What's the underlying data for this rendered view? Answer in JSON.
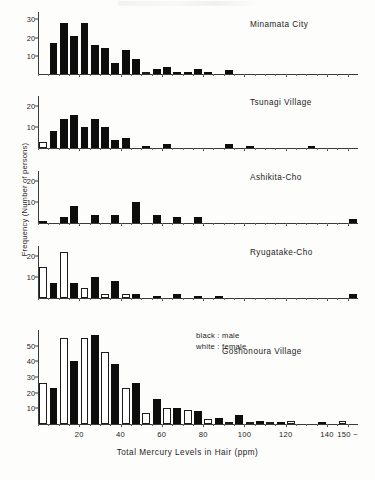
{
  "figure": {
    "xlabel": "Total Mercury Levels in Hair  (ppm)",
    "ylabel": "Frequency (Number of persons)",
    "legend": {
      "male": "black : male",
      "female": "white : female"
    },
    "x_ticks": [
      {
        "value": 20,
        "label": "20"
      },
      {
        "value": 40,
        "label": "40"
      },
      {
        "value": 60,
        "label": "60"
      },
      {
        "value": 80,
        "label": "80"
      },
      {
        "value": 100,
        "label": "100"
      },
      {
        "value": 120,
        "label": "120"
      },
      {
        "value": 140,
        "label": "140"
      },
      {
        "value": 150,
        "label": "150 ~"
      }
    ]
  },
  "chart_data": {
    "type": "bar",
    "title": "",
    "xlabel": "Total Mercury Levels in Hair  (ppm)",
    "ylabel": "Frequency (Number of persons)",
    "xlim": [
      0,
      155
    ],
    "bin_width": 5,
    "grid": false,
    "legend_position": "inside-top-right",
    "series_colors": {
      "male": "#0d0d0d",
      "female": "#ffffff"
    },
    "bin_starts": [
      0,
      5,
      10,
      15,
      20,
      25,
      30,
      35,
      40,
      45,
      50,
      55,
      60,
      65,
      70,
      75,
      80,
      85,
      90,
      95,
      100,
      105,
      110,
      115,
      120,
      125,
      130,
      135,
      140,
      145,
      150
    ],
    "panels": [
      {
        "name": "Minamata City",
        "ylim": [
          0,
          34
        ],
        "y_ticks": [
          10,
          20,
          30
        ],
        "series": [
          {
            "name": "female",
            "values": [
              0,
              0,
              8,
              0,
              2,
              1,
              2,
              1,
              1,
              1,
              1,
              0,
              0,
              0,
              0,
              0,
              0,
              0,
              0,
              0,
              0,
              0,
              0,
              0,
              0,
              0,
              0,
              0,
              0,
              0,
              0
            ]
          },
          {
            "name": "male",
            "values": [
              0,
              17,
              28,
              21,
              28,
              16,
              14,
              6,
              13,
              8,
              0,
              3,
              4,
              1,
              1,
              3,
              1,
              0,
              2,
              0,
              0,
              0,
              0,
              0,
              0,
              0,
              0,
              0,
              0,
              0,
              0
            ]
          }
        ]
      },
      {
        "name": "Tsunagi Village",
        "ylim": [
          0,
          25
        ],
        "y_ticks": [
          10,
          20
        ],
        "series": [
          {
            "name": "female",
            "values": [
              3,
              0,
              2,
              0,
              3,
              0,
              3,
              0,
              0,
              0,
              0,
              0,
              1,
              0,
              0,
              0,
              0,
              0,
              0,
              0,
              0,
              0,
              0,
              0,
              0,
              0,
              0,
              0,
              0,
              0,
              0
            ]
          },
          {
            "name": "male",
            "values": [
              0,
              8,
              14,
              16,
              10,
              14,
              10,
              4,
              5,
              0,
              1,
              0,
              2,
              0,
              0,
              0,
              0,
              0,
              2,
              0,
              1,
              0,
              0,
              0,
              0,
              0,
              1,
              0,
              0,
              0,
              0
            ]
          }
        ]
      },
      {
        "name": "Ashikita-Cho",
        "ylim": [
          0,
          25
        ],
        "y_ticks": [
          10,
          20
        ],
        "series": [
          {
            "name": "female",
            "values": [
              0,
              0,
              0,
              0,
              0,
              0,
              0,
              0,
              0,
              0,
              0,
              0,
              0,
              0,
              0,
              0,
              0,
              0,
              0,
              0,
              0,
              0,
              0,
              0,
              0,
              0,
              0,
              0,
              0,
              0,
              0
            ]
          },
          {
            "name": "male",
            "values": [
              1,
              0,
              3,
              8,
              0,
              4,
              0,
              4,
              0,
              10,
              0,
              4,
              0,
              3,
              0,
              3,
              0,
              0,
              0,
              0,
              0,
              0,
              0,
              0,
              0,
              0,
              0,
              0,
              0,
              0,
              2
            ]
          }
        ]
      },
      {
        "name": "Ryugatake-Cho",
        "ylim": [
          0,
          25
        ],
        "y_ticks": [
          10,
          20
        ],
        "series": [
          {
            "name": "female",
            "values": [
              15,
              0,
              22,
              0,
              5,
              0,
              2,
              0,
              2,
              0,
              0,
              0,
              0,
              0,
              0,
              0,
              0,
              0,
              0,
              0,
              0,
              0,
              0,
              0,
              0,
              0,
              0,
              0,
              0,
              0,
              0
            ]
          },
          {
            "name": "male",
            "values": [
              0,
              7,
              0,
              7,
              0,
              10,
              0,
              8,
              0,
              2,
              0,
              1,
              0,
              2,
              0,
              1,
              0,
              1,
              0,
              0,
              0,
              0,
              0,
              0,
              0,
              0,
              0,
              0,
              0,
              0,
              2
            ]
          }
        ]
      },
      {
        "name": "Goshonoura Village",
        "ylim": [
          0,
          60
        ],
        "y_ticks": [
          10,
          20,
          30,
          40,
          50
        ],
        "series": [
          {
            "name": "female",
            "values": [
              26,
              0,
              55,
              0,
              55,
              0,
              46,
              0,
              23,
              0,
              7,
              0,
              10,
              0,
              9,
              0,
              3,
              0,
              1,
              0,
              1,
              0,
              1,
              0,
              2,
              0,
              0,
              0,
              0,
              2,
              0
            ]
          },
          {
            "name": "male",
            "values": [
              0,
              23,
              0,
              40,
              0,
              57,
              0,
              38,
              0,
              26,
              0,
              16,
              0,
              10,
              0,
              8,
              0,
              4,
              0,
              6,
              0,
              2,
              0,
              1,
              0,
              0,
              0,
              1,
              0,
              0,
              0
            ]
          }
        ]
      }
    ]
  }
}
